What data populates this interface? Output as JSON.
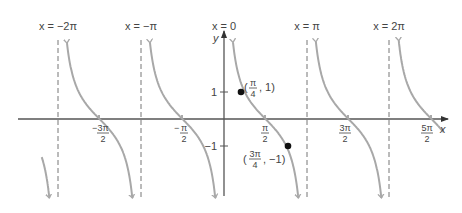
{
  "chart_data": {
    "type": "line",
    "title": "",
    "function": "y = cot x",
    "xlabel": "x",
    "ylabel": "y",
    "xlim": [
      -7.0,
      8.5
    ],
    "ylim": [
      -3.0,
      3.3
    ],
    "grid": false,
    "legend": null,
    "asymptotes": [
      {
        "x": -6.2832,
        "label": "x = -2π"
      },
      {
        "x": -3.1416,
        "label": "x = -π"
      },
      {
        "x": 0,
        "label": "x = 0"
      },
      {
        "x": 3.1416,
        "label": "x = π"
      },
      {
        "x": 6.2832,
        "label": "x = 2π"
      }
    ],
    "x_ticks": [
      {
        "value": -4.7124,
        "label": "-3π/2"
      },
      {
        "value": -1.5708,
        "label": "-π/2"
      },
      {
        "value": 1.5708,
        "label": "π/2"
      },
      {
        "value": 4.7124,
        "label": "3π/2"
      },
      {
        "value": 7.854,
        "label": "5π/2"
      }
    ],
    "y_ticks": [
      {
        "value": 1,
        "label": "1"
      },
      {
        "value": -1,
        "label": "-1"
      }
    ],
    "points": [
      {
        "x": 0.7854,
        "y": 1,
        "label": "(π/4, 1)"
      },
      {
        "x": 2.3562,
        "y": -1,
        "label": "(3π/4, -1)"
      }
    ],
    "series": [
      {
        "name": "cot x",
        "color": "#a8a8a8",
        "branches": [
          {
            "x_from": -6.9,
            "x_to": -6.33
          },
          {
            "x_from": -6.23,
            "x_to": -3.19
          },
          {
            "x_from": -3.09,
            "x_to": -0.05
          },
          {
            "x_from": 0.05,
            "x_to": 3.09
          },
          {
            "x_from": 3.19,
            "x_to": 6.23
          },
          {
            "x_from": 6.33,
            "x_to": 8.3
          }
        ]
      }
    ]
  },
  "labels": {
    "asym_neg2pi": "x = −2π",
    "asym_negpi": "x = −π",
    "asym_zero": "x = 0",
    "asym_pi": "x = π",
    "asym_2pi": "x = 2π",
    "axis_x": "x",
    "axis_y": "y",
    "ytick_1": "1",
    "ytick_neg1": "−1",
    "pt1": "(π/4, 1)",
    "pt2": "(3π/4, −1)"
  },
  "colors": {
    "curve": "#a8a8a8",
    "axis": "#555555",
    "asymptote": "#777777",
    "point": "#111111"
  }
}
